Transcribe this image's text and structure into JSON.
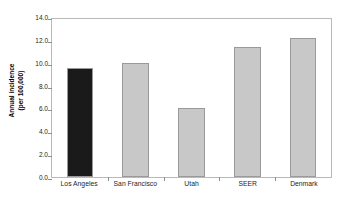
{
  "chart_data": {
    "type": "bar",
    "title": "",
    "xlabel": "",
    "ylabel_line1": "Annual incidence",
    "ylabel_line2": "(per 100,000)",
    "categories": [
      "Los Angeles",
      "San Francisco",
      "Utah",
      "SEER",
      "Denmark"
    ],
    "values": [
      9.5,
      10.0,
      6.0,
      11.4,
      12.2
    ],
    "bar_colors": [
      "#1a1a1a",
      "#c8c8c8",
      "#c8c8c8",
      "#c8c8c8",
      "#c8c8c8"
    ],
    "bar_border_color": "#9a9a9a",
    "ylim": [
      0.0,
      14.0
    ],
    "ytick_step": 2.0,
    "ytick_labels": [
      "14.0",
      "12.0",
      "10.0",
      "8.0",
      "6.0",
      "4.0",
      "2.0",
      "0.0"
    ],
    "ytick_values": [
      14.0,
      12.0,
      10.0,
      8.0,
      6.0,
      4.0,
      2.0,
      0.0
    ],
    "grid": false,
    "legend": null,
    "frame_color": "#b9b9b9"
  }
}
